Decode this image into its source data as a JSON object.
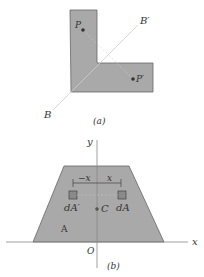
{
  "figure_a": {
    "caption": "(a)",
    "labels": {
      "P": "P",
      "P_prime": "P′",
      "B": "B",
      "B_prime": "B′"
    },
    "shape": "L-shaped area",
    "fill_color": "#a9a9a9"
  },
  "figure_b": {
    "caption": "(b)",
    "labels": {
      "y_axis": "y",
      "x_axis": "x",
      "origin": "O",
      "area": "A",
      "centroid": "C",
      "dA": "dA",
      "dA_prime": "dA′",
      "x_dim": "x",
      "neg_x_dim": "−x"
    },
    "shape": "trapezoid symmetric about y-axis",
    "fill_color": "#a9a9a9"
  }
}
